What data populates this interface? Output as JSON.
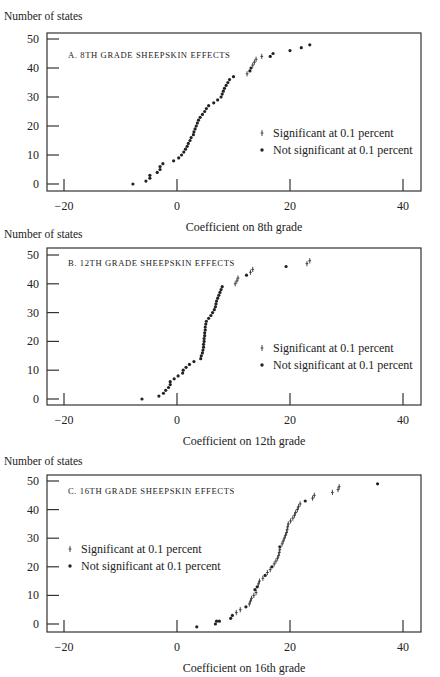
{
  "chart_data": [
    {
      "type": "scatter",
      "panel": "A",
      "title": "A. 8th grade sheepskin effects",
      "xlabel": "Coefficient on 8th grade",
      "ylabel": "Number of states",
      "xlim": [
        -23,
        43
      ],
      "ylim": [
        -2,
        52
      ],
      "xticks": [
        -20,
        0,
        20,
        40
      ],
      "yticks": [
        0,
        10,
        20,
        30,
        40,
        50
      ],
      "grid": false,
      "legend_position": "right-middle",
      "legend": [
        {
          "marker": "plus",
          "label": "Significant at 0.1 percent"
        },
        {
          "marker": "dot",
          "label": "Not significant at 0.1 percent"
        }
      ],
      "series": [
        {
          "name": "Not significant at 0.1 percent",
          "marker": "dot",
          "points": [
            [
              -7.8,
              0
            ],
            [
              -5.5,
              1
            ],
            [
              -4.8,
              2
            ],
            [
              -4.8,
              3
            ],
            [
              -3.5,
              4
            ],
            [
              -3,
              5
            ],
            [
              -3,
              6
            ],
            [
              -2.5,
              7
            ],
            [
              -0.6,
              8
            ],
            [
              0.3,
              9
            ],
            [
              0.8,
              10
            ],
            [
              1.2,
              11
            ],
            [
              1.5,
              12
            ],
            [
              1.8,
              13
            ],
            [
              2,
              14
            ],
            [
              2.3,
              15
            ],
            [
              2.5,
              16
            ],
            [
              2.9,
              17
            ],
            [
              3,
              18
            ],
            [
              3.2,
              19
            ],
            [
              3.4,
              20
            ],
            [
              3.6,
              21
            ],
            [
              3.8,
              22
            ],
            [
              4.1,
              23
            ],
            [
              4.5,
              24
            ],
            [
              4.9,
              25
            ],
            [
              5.2,
              26
            ],
            [
              5.6,
              27
            ],
            [
              6.5,
              28
            ],
            [
              7.2,
              29
            ],
            [
              7.8,
              30
            ],
            [
              8,
              31
            ],
            [
              8.2,
              32
            ],
            [
              8.4,
              33
            ],
            [
              8.7,
              34
            ],
            [
              9,
              35
            ],
            [
              9.3,
              36
            ],
            [
              10,
              37
            ],
            [
              12.9,
              39
            ],
            [
              13.1,
              40
            ],
            [
              16.5,
              44
            ],
            [
              17,
              45
            ],
            [
              20,
              46
            ],
            [
              22,
              47
            ],
            [
              23.5,
              48
            ]
          ]
        },
        {
          "name": "Significant at 0.1 percent",
          "marker": "plus",
          "points": [
            [
              12.4,
              38
            ],
            [
              13.4,
              41
            ],
            [
              13.7,
              42
            ],
            [
              14,
              43
            ],
            [
              15,
              44
            ]
          ]
        }
      ]
    },
    {
      "type": "scatter",
      "panel": "B",
      "title": "B. 12th grade sheepskin effects",
      "xlabel": "Coefficient on 12th grade",
      "ylabel": "Number of states",
      "xlim": [
        -23,
        43
      ],
      "ylim": [
        -2,
        52
      ],
      "xticks": [
        -20,
        0,
        20,
        40
      ],
      "yticks": [
        0,
        10,
        20,
        30,
        40,
        50
      ],
      "grid": false,
      "legend_position": "right-middle",
      "legend": [
        {
          "marker": "plus",
          "label": "Significant at 0.1 percent"
        },
        {
          "marker": "dot",
          "label": "Not significant at 0.1 percent"
        }
      ],
      "series": [
        {
          "name": "Not significant at 0.1 percent",
          "marker": "dot",
          "points": [
            [
              -6.2,
              0
            ],
            [
              -3.2,
              1
            ],
            [
              -2.4,
              2
            ],
            [
              -2,
              3
            ],
            [
              -1.5,
              4
            ],
            [
              -1.2,
              5
            ],
            [
              -1.2,
              6
            ],
            [
              -0.5,
              7
            ],
            [
              0.2,
              8
            ],
            [
              1,
              9
            ],
            [
              1.1,
              10
            ],
            [
              1.6,
              11
            ],
            [
              2.2,
              12
            ],
            [
              3,
              13
            ],
            [
              4.2,
              14
            ],
            [
              4.3,
              15
            ],
            [
              4.5,
              16
            ],
            [
              4.6,
              17
            ],
            [
              4.7,
              18
            ],
            [
              4.7,
              19
            ],
            [
              4.8,
              20
            ],
            [
              4.8,
              21
            ],
            [
              4.9,
              22
            ],
            [
              4.9,
              23
            ],
            [
              5,
              24
            ],
            [
              5,
              25
            ],
            [
              5.1,
              26
            ],
            [
              5.2,
              27
            ],
            [
              5.6,
              28
            ],
            [
              6,
              29
            ],
            [
              6.3,
              30
            ],
            [
              6.6,
              31
            ],
            [
              6.8,
              32
            ],
            [
              6.9,
              33
            ],
            [
              7,
              34
            ],
            [
              7.2,
              35
            ],
            [
              7.4,
              36
            ],
            [
              7.6,
              37
            ],
            [
              7.8,
              38
            ],
            [
              8,
              39
            ],
            [
              12.3,
              43
            ],
            [
              19.3,
              46
            ]
          ]
        },
        {
          "name": "Significant at 0.1 percent",
          "marker": "plus",
          "points": [
            [
              10.3,
              40
            ],
            [
              10.6,
              41
            ],
            [
              10.8,
              42
            ],
            [
              13,
              44
            ],
            [
              13.4,
              45
            ],
            [
              23,
              47
            ],
            [
              23.5,
              48
            ]
          ]
        }
      ]
    },
    {
      "type": "scatter",
      "panel": "C",
      "title": "C. 16th grade sheepskin effects",
      "xlabel": "Coefficient on 16th grade",
      "ylabel": "Number of states",
      "xlim": [
        -23,
        43
      ],
      "ylim": [
        -2,
        52
      ],
      "xticks": [
        -20,
        0,
        20,
        40
      ],
      "yticks": [
        0,
        10,
        20,
        30,
        40,
        50
      ],
      "grid": false,
      "legend_position": "left-middle",
      "legend": [
        {
          "marker": "plus",
          "label": "Significant at 0.1 percent"
        },
        {
          "marker": "dot",
          "label": "Not significant at 0.1 percent"
        }
      ],
      "series": [
        {
          "name": "Not significant at 0.1 percent",
          "marker": "dot",
          "points": [
            [
              3.5,
              -1
            ],
            [
              6.8,
              0
            ],
            [
              7,
              1
            ],
            [
              7.5,
              1
            ],
            [
              9.5,
              2
            ],
            [
              9.8,
              3
            ],
            [
              12.2,
              6
            ],
            [
              13.8,
              12
            ],
            [
              14.2,
              13
            ],
            [
              15.6,
              17
            ],
            [
              16.8,
              20
            ],
            [
              18.2,
              27
            ],
            [
              22.7,
              43
            ],
            [
              35.5,
              49
            ]
          ]
        },
        {
          "name": "Significant at 0.1 percent",
          "marker": "plus",
          "points": [
            [
              10.5,
              4
            ],
            [
              11.2,
              5
            ],
            [
              12.8,
              7
            ],
            [
              13,
              8
            ],
            [
              13.2,
              9
            ],
            [
              13.6,
              10
            ],
            [
              14,
              11
            ],
            [
              14.4,
              14
            ],
            [
              14.6,
              15
            ],
            [
              15.2,
              16
            ],
            [
              16,
              18
            ],
            [
              16.5,
              19
            ],
            [
              17.2,
              21
            ],
            [
              17.5,
              22
            ],
            [
              17.8,
              23
            ],
            [
              18,
              24
            ],
            [
              18.1,
              25
            ],
            [
              18.2,
              26
            ],
            [
              18.6,
              28
            ],
            [
              18.8,
              29
            ],
            [
              19,
              30
            ],
            [
              19.2,
              31
            ],
            [
              19.4,
              32
            ],
            [
              19.5,
              33
            ],
            [
              19.6,
              34
            ],
            [
              19.7,
              35
            ],
            [
              20.1,
              36
            ],
            [
              20.5,
              37
            ],
            [
              20.8,
              38
            ],
            [
              21,
              39
            ],
            [
              21.3,
              40
            ],
            [
              21.5,
              41
            ],
            [
              21.8,
              42
            ],
            [
              24,
              44
            ],
            [
              24.3,
              45
            ],
            [
              27.5,
              46
            ],
            [
              28.5,
              47
            ],
            [
              28.7,
              48
            ]
          ]
        }
      ]
    }
  ],
  "panels": [
    {
      "id": "A",
      "ylabel": "Number of states",
      "title": "A. 8th grade sheepskin effects",
      "xlabel": "Coefficient on 8th grade",
      "legend_sig": "Significant at 0.1 percent",
      "legend_nonsig": "Not significant at 0.1 percent"
    },
    {
      "id": "B",
      "ylabel": "Number of states",
      "title": "B. 12th grade sheepskin effects",
      "xlabel": "Coefficient on 12th grade",
      "legend_sig": "Significant at 0.1 percent",
      "legend_nonsig": "Not significant at 0.1 percent"
    },
    {
      "id": "C",
      "ylabel": "Number of states",
      "title": "C. 16th grade sheepskin effects",
      "xlabel": "Coefficient on 16th grade",
      "legend_sig": "Significant at 0.1 percent",
      "legend_nonsig": "Not significant at 0.1 percent"
    }
  ],
  "ticks": {
    "x": [
      "−20",
      "0",
      "20",
      "40"
    ],
    "y": [
      "0",
      "10",
      "20",
      "30",
      "40",
      "50"
    ]
  }
}
